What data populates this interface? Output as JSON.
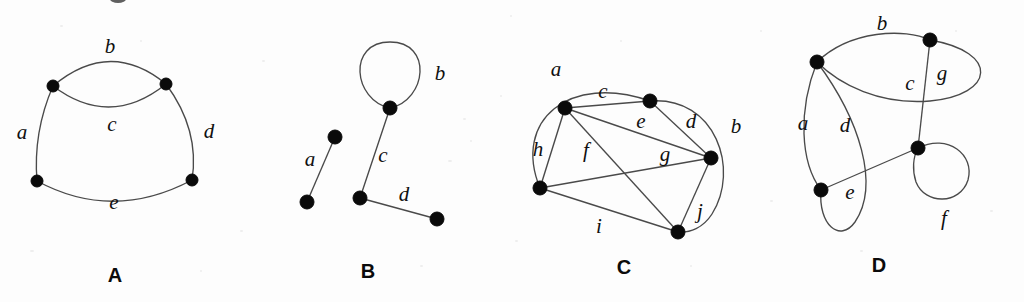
{
  "figure": {
    "background_color": "#fdfdfd",
    "edge_color": "#4a4a4a",
    "vertex_color": "#0a0a0a",
    "label_color": "#101010",
    "panels": [
      {
        "id": "A",
        "caption": "A",
        "caption_x": 115,
        "caption_y": 264,
        "description": "Four vertices with a double edge between the two upper vertices",
        "vertices": [
          {
            "name": "v1",
            "x": 53,
            "y": 86,
            "r": 6
          },
          {
            "name": "v2",
            "x": 166,
            "y": 84,
            "r": 6
          },
          {
            "name": "v3",
            "x": 37,
            "y": 181,
            "r": 6
          },
          {
            "name": "v4",
            "x": 192,
            "y": 180,
            "r": 6
          }
        ],
        "edges": [
          {
            "label": "a",
            "from": "v1",
            "to": "v3",
            "path": "M 53 86 Q 33 132 37 181",
            "label_x": 22,
            "label_y": 134
          },
          {
            "label": "b",
            "from": "v1",
            "to": "v2",
            "path": "M 53 86 Q 110 38 166 84",
            "label_x": 110,
            "label_y": 48
          },
          {
            "label": "c",
            "from": "v1",
            "to": "v2",
            "path": "M 53 86 Q 110 129 166 84",
            "label_x": 112,
            "label_y": 126
          },
          {
            "label": "d",
            "from": "v2",
            "to": "v4",
            "path": "M 166 84 Q 200 130 192 180",
            "label_x": 209,
            "label_y": 133
          },
          {
            "label": "e",
            "from": "v3",
            "to": "v4",
            "path": "M 37 181 Q 113 222 192 180",
            "label_x": 114,
            "label_y": 204
          }
        ]
      },
      {
        "id": "B",
        "caption": "B",
        "caption_x": 368,
        "caption_y": 260,
        "description": "A self loop, an isolated edge, and a path of two edges",
        "vertices": [
          {
            "name": "v1",
            "x": 390,
            "y": 108,
            "r": 7
          },
          {
            "name": "v2",
            "x": 360,
            "y": 198,
            "r": 7
          },
          {
            "name": "v3",
            "x": 437,
            "y": 219,
            "r": 7
          },
          {
            "name": "v4",
            "x": 335,
            "y": 137,
            "r": 7
          },
          {
            "name": "v5",
            "x": 307,
            "y": 202,
            "r": 7
          }
        ],
        "edges": [
          {
            "label": "a",
            "from": "v4",
            "to": "v5",
            "path": "M 335 137 L 307 202",
            "label_x": 310,
            "label_y": 161
          },
          {
            "label": "b",
            "from": "v1",
            "to": "v1",
            "path": "M 390 108 C 353 100 347 42 390 42 C 433 42 427 100 390 108",
            "label_x": 440,
            "label_y": 75
          },
          {
            "label": "c",
            "from": "v1",
            "to": "v2",
            "path": "M 390 108 L 360 198",
            "label_x": 383,
            "label_y": 157
          },
          {
            "label": "d",
            "from": "v2",
            "to": "v3",
            "path": "M 360 198 L 437 219",
            "label_x": 404,
            "label_y": 196
          }
        ]
      },
      {
        "id": "C",
        "caption": "C",
        "caption_x": 624,
        "caption_y": 256,
        "description": "Five vertices joined by ten edges including two outer curved edges",
        "vertices": [
          {
            "name": "v1",
            "x": 565,
            "y": 108,
            "r": 7
          },
          {
            "name": "v2",
            "x": 650,
            "y": 101,
            "r": 7
          },
          {
            "name": "v3",
            "x": 711,
            "y": 158,
            "r": 7
          },
          {
            "name": "v4",
            "x": 540,
            "y": 188,
            "r": 7
          },
          {
            "name": "v5",
            "x": 678,
            "y": 232,
            "r": 7
          }
        ],
        "edges": [
          {
            "label": "a",
            "from": "v4",
            "to": "v2",
            "path": "M 540 188 C 512 120 570 73 650 101",
            "label_x": 556,
            "label_y": 71
          },
          {
            "label": "b",
            "from": "v2",
            "to": "v5",
            "path": "M 650 101 C 716 96 740 170 712 214 C 703 228 690 233 678 232",
            "label_x": 736,
            "label_y": 128
          },
          {
            "label": "c",
            "from": "v1",
            "to": "v2",
            "path": "M 565 108 L 650 101",
            "label_x": 603,
            "label_y": 93
          },
          {
            "label": "d",
            "from": "v2",
            "to": "v3",
            "path": "M 650 101 L 711 158",
            "label_x": 691,
            "label_y": 123
          },
          {
            "label": "e",
            "from": "v1",
            "to": "v3",
            "path": "M 565 108 L 711 158",
            "label_x": 641,
            "label_y": 123
          },
          {
            "label": "f",
            "from": "v1",
            "to": "v5",
            "path": "M 565 108 L 678 232",
            "label_x": 586,
            "label_y": 152
          },
          {
            "label": "g",
            "from": "v4",
            "to": "v3",
            "path": "M 540 188 L 711 158",
            "label_x": 665,
            "label_y": 156
          },
          {
            "label": "h",
            "from": "v1",
            "to": "v4",
            "path": "M 565 108 L 540 188",
            "label_x": 538,
            "label_y": 151
          },
          {
            "label": "i",
            "from": "v4",
            "to": "v5",
            "path": "M 540 188 L 678 232",
            "label_x": 599,
            "label_y": 228
          },
          {
            "label": "j",
            "from": "v3",
            "to": "v5",
            "path": "M 711 158 L 678 232",
            "label_x": 700,
            "label_y": 213
          }
        ]
      },
      {
        "id": "D",
        "caption": "D",
        "caption_x": 879,
        "caption_y": 254,
        "description": "Four vertices with two pairs of parallel curved edges and a self loop",
        "vertices": [
          {
            "name": "v1",
            "x": 817,
            "y": 62,
            "r": 7
          },
          {
            "name": "v2",
            "x": 930,
            "y": 40,
            "r": 7
          },
          {
            "name": "v3",
            "x": 918,
            "y": 148,
            "r": 7
          },
          {
            "name": "v4",
            "x": 821,
            "y": 190,
            "r": 7
          }
        ],
        "edges": [
          {
            "label": "a",
            "from": "v1",
            "to": "v4",
            "path": "M 817 62 C 798 110 800 162 821 190",
            "label_x": 803,
            "label_y": 125
          },
          {
            "label": "b",
            "from": "v1",
            "to": "v2",
            "path": "M 817 62 C 850 30 905 28 930 40",
            "label_x": 882,
            "label_y": 25
          },
          {
            "label": "c",
            "from": "v2",
            "to": "v1",
            "path": "M 930 40 C 1000 52 995 95 930 101 C 880 105 840 85 817 62",
            "label_x": 910,
            "label_y": 85
          },
          {
            "label": "d",
            "from": "v1",
            "to": "v4",
            "path": "M 817 62 C 860 120 880 185 855 222 C 840 243 818 225 821 190",
            "label_x": 845,
            "label_y": 127
          },
          {
            "label": "e",
            "from": "v4",
            "to": "v3",
            "path": "M 821 190 L 918 148",
            "label_x": 850,
            "label_y": 194
          },
          {
            "label": "f",
            "from": "v3",
            "to": "v3",
            "path": "M 918 148 C 948 133 975 155 968 180 C 960 205 925 205 916 182 C 912 170 913 157 918 148",
            "label_x": 944,
            "label_y": 220
          },
          {
            "label": "g",
            "from": "v2",
            "to": "v3",
            "path": "M 930 40 L 918 148",
            "label_x": 942,
            "label_y": 75
          }
        ]
      }
    ]
  }
}
